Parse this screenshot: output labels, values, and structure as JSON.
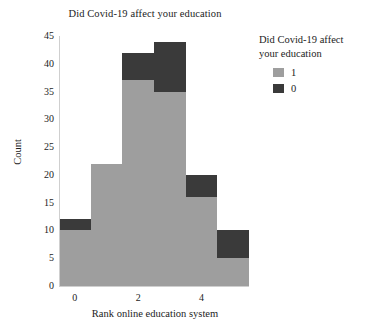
{
  "chart_data": {
    "type": "bar",
    "subtype": "stacked-histogram",
    "title": "Did Covid-19 affect your education",
    "xlabel": "Rank online education system",
    "ylabel": "Count",
    "categories": [
      "0",
      "1",
      "2",
      "3",
      "4",
      "5"
    ],
    "x": [
      0,
      1,
      2,
      3,
      4,
      5
    ],
    "xlim": [
      -0.5,
      5.5
    ],
    "ylim": [
      0,
      45
    ],
    "xticks": [
      "0",
      "2",
      "4"
    ],
    "xtick_values": [
      0,
      2,
      4
    ],
    "yticks": [
      "0",
      "5",
      "10",
      "15",
      "20",
      "25",
      "30",
      "35",
      "40",
      "45"
    ],
    "ytick_values": [
      0,
      5,
      10,
      15,
      20,
      25,
      30,
      35,
      40,
      45
    ],
    "grid": false,
    "legend_position": "right",
    "series": [
      {
        "name": "1",
        "color": "#9e9e9e",
        "values": [
          10,
          22,
          37,
          35,
          16,
          5
        ]
      },
      {
        "name": "0",
        "color": "#3a3a3a",
        "values": [
          2,
          0,
          5,
          9,
          4,
          5
        ]
      }
    ],
    "totals": [
      12,
      22,
      42,
      44,
      20,
      10
    ],
    "background_color": "#ffffff"
  },
  "legend": {
    "title_line_1": "Did Covid-19 affect",
    "title_line_2": "your education",
    "entries": [
      {
        "label": "1",
        "color": "#9e9e9e"
      },
      {
        "label": "0",
        "color": "#3a3a3a"
      }
    ]
  }
}
